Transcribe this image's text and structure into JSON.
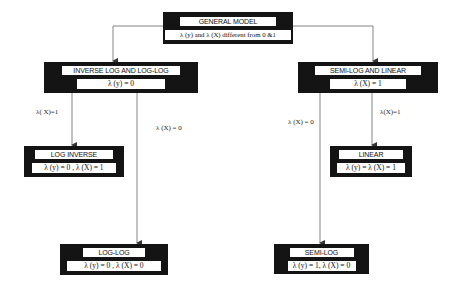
{
  "diagram": {
    "nodes": {
      "general": {
        "title": "GENERAL MODEL",
        "condition": "λ (y) and λ (X) different from 0 &1"
      },
      "inverse_loglog": {
        "title": "INVERSE LOG AND LOG-LOG",
        "condition": "λ (y) = 0"
      },
      "semilog_linear": {
        "title": "SEMI-LOG AND LINEAR",
        "condition": "λ (X) = 1"
      },
      "log_inverse": {
        "title": "LOG INVERSE",
        "condition": "λ (y) = 0 , λ (X) = 1"
      },
      "linear": {
        "title": "LINEAR",
        "condition": "λ (y) = λ (X) = 1"
      },
      "loglog": {
        "title": "LOG-LOG",
        "condition": "λ (y) = 0 , λ (X) = 0"
      },
      "semilog": {
        "title": "SEMI-LOG",
        "condition": "λ (y) = 1, λ (X) = 0"
      }
    },
    "edge_labels": {
      "to_log_inverse": "λ( X)=1",
      "to_loglog": "λ (X) = 0",
      "to_semilog": "λ (X) = 0",
      "to_linear": "λ(X)=1"
    },
    "colors": {
      "box": "#141414",
      "line": "#555555",
      "background": "#ffffff"
    }
  }
}
